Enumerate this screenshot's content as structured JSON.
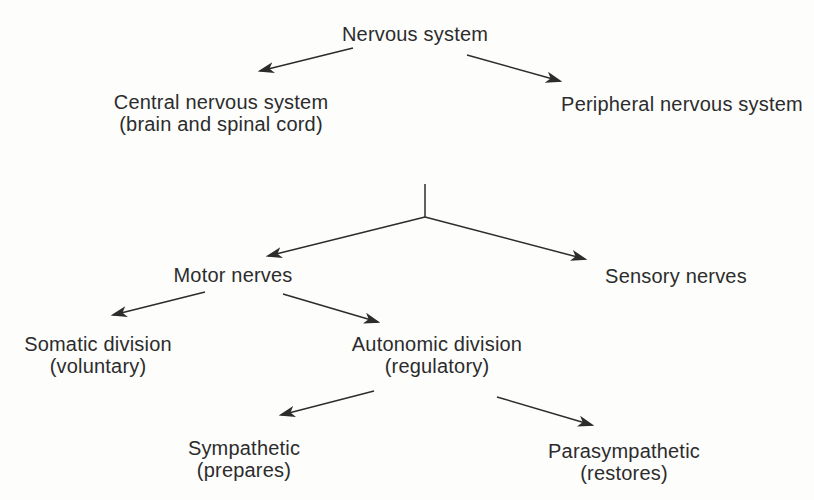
{
  "diagram": {
    "kind": "tree-flowchart",
    "topic": "Organization of the nervous system",
    "colors": {
      "background": "#fdfdfc",
      "ink": "#2c2c2c"
    },
    "nodes": {
      "nervous_system": {
        "label": "Nervous system"
      },
      "central": {
        "label": "Central nervous system",
        "sub": "(brain and spinal cord)"
      },
      "peripheral": {
        "label": "Peripheral nervous system"
      },
      "motor": {
        "label": "Motor nerves"
      },
      "sensory": {
        "label": "Sensory nerves"
      },
      "somatic": {
        "label": "Somatic division",
        "sub": "(voluntary)"
      },
      "autonomic": {
        "label": "Autonomic division",
        "sub": "(regulatory)"
      },
      "sympathetic": {
        "label": "Sympathetic",
        "sub": "(prepares)"
      },
      "parasympathetic": {
        "label": "Parasympathetic",
        "sub": "(restores)"
      }
    },
    "edges": [
      {
        "from": "nervous_system",
        "to": "central"
      },
      {
        "from": "nervous_system",
        "to": "peripheral"
      },
      {
        "from": "peripheral",
        "to": "motor"
      },
      {
        "from": "peripheral",
        "to": "sensory"
      },
      {
        "from": "motor",
        "to": "somatic"
      },
      {
        "from": "motor",
        "to": "autonomic"
      },
      {
        "from": "autonomic",
        "to": "sympathetic"
      },
      {
        "from": "autonomic",
        "to": "parasympathetic"
      }
    ]
  }
}
